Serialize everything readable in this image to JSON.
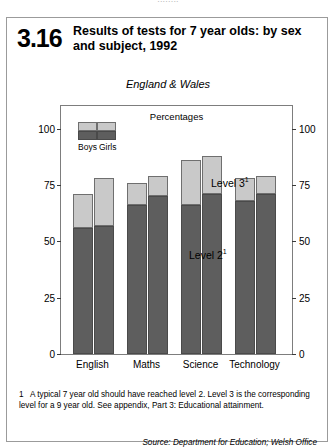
{
  "page": {
    "cut_off_top_line": "........"
  },
  "header": {
    "number": "3.16",
    "title": "Results of tests for 7 year olds: by sex and subject, 1992"
  },
  "chart_data": {
    "type": "bar",
    "subtype": "stacked-grouped",
    "title": "Results of tests for 7 year olds: by sex and subject, 1992",
    "subtitle": "England & Wales",
    "unit_label": "Percentages",
    "xlabel": "",
    "ylabel": "",
    "ylim": [
      0,
      110
    ],
    "yticks": [
      0,
      25,
      50,
      75,
      100
    ],
    "ytick_labels": [
      "0",
      "25",
      "50",
      "75",
      "100"
    ],
    "grid": false,
    "axis_both_sides": true,
    "categories": [
      "English",
      "Maths",
      "Science",
      "Technology"
    ],
    "groups": [
      "Boys",
      "Girls"
    ],
    "stack_order": [
      "Level 2",
      "Level 3"
    ],
    "series": [
      {
        "name": "Boys Level 2",
        "group": "Boys",
        "stack": "Level 2",
        "values": [
          56,
          66,
          66,
          68
        ]
      },
      {
        "name": "Boys Level 3",
        "group": "Boys",
        "stack": "Level 3",
        "values": [
          15,
          10,
          20,
          10
        ]
      },
      {
        "name": "Girls Level 2",
        "group": "Girls",
        "stack": "Level 2",
        "values": [
          57,
          70,
          71,
          71
        ]
      },
      {
        "name": "Girls Level 3",
        "group": "Girls",
        "stack": "Level 3",
        "values": [
          21,
          9,
          17,
          8
        ]
      }
    ],
    "totals": {
      "Boys": [
        71,
        76,
        86,
        78
      ],
      "Girls": [
        78,
        79,
        88,
        79
      ]
    },
    "annotations": [
      {
        "text": "Level 3",
        "footnote_marker": "1"
      },
      {
        "text": "Level 2",
        "footnote_marker": "1"
      }
    ],
    "legend": {
      "position": "inside-top-left",
      "entries": [
        "Boys",
        "Girls"
      ]
    },
    "colors": {
      "level_2": "#5e5e5e",
      "level_3": "#c9c9c9",
      "axis": "#3a3a3a",
      "frame": "#7d7d7d"
    }
  },
  "labels": {
    "level3": "Level 3",
    "level3_sup": "1",
    "level2": "Level 2",
    "level2_sup": "1",
    "legend_boys": "Boys",
    "legend_girls": "Girls"
  },
  "footnote": {
    "marker": "1",
    "text": "A typical 7 year old should have reached level 2. Level 3 is the corresponding level for a 9 year old. See appendix, Part 3: Educational attainment."
  },
  "source": {
    "text": "Source: Department for Education; Welsh Office"
  }
}
